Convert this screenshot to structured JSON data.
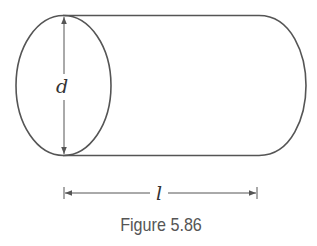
{
  "figure": {
    "caption": "Figure 5.86",
    "shape": "cylinder",
    "labels": {
      "diameter": "d",
      "length": "l"
    },
    "colors": {
      "stroke": "#555555",
      "text": "#333333",
      "background": "#ffffff"
    }
  }
}
